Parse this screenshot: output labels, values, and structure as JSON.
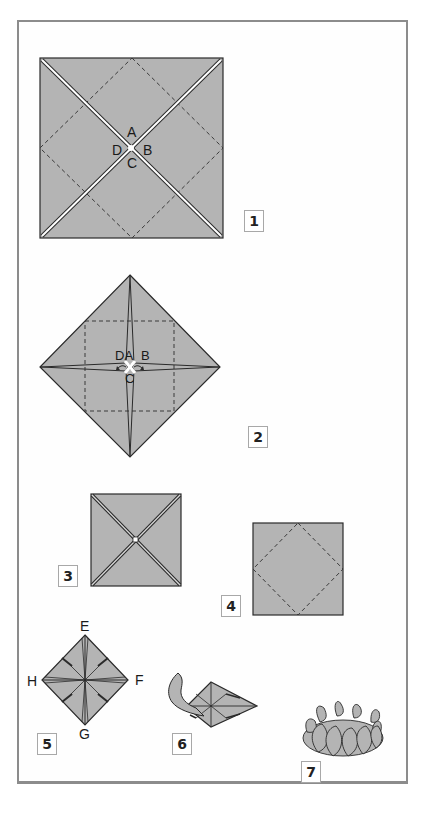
{
  "diagram": {
    "type": "origami-instructions",
    "colors": {
      "paper_fill": "#b4b4b4",
      "outline": "#2a2a2a",
      "frame_border": "#8c8c8c",
      "background": "#ffffff"
    },
    "steps": [
      {
        "number": "1",
        "figure": "square with diagonal creases and dashed inner diamond",
        "point_labels": [
          "A",
          "B",
          "C",
          "D"
        ]
      },
      {
        "number": "2",
        "figure": "diamond with corners folded to center, dashed inner square",
        "point_labels": [
          "D",
          "A",
          "B",
          "C"
        ]
      },
      {
        "number": "3",
        "figure": "small square with diagonal folds"
      },
      {
        "number": "4",
        "figure": "square with dashed inner diamond"
      },
      {
        "number": "5",
        "figure": "diamond with folded flaps",
        "point_labels": [
          "E",
          "F",
          "G",
          "H"
        ]
      },
      {
        "number": "6",
        "figure": "pulling out petal"
      },
      {
        "number": "7",
        "figure": "finished lotus"
      }
    ]
  },
  "labels": {
    "step1": {
      "A": "A",
      "B": "B",
      "C": "C",
      "D": "D",
      "num": "1"
    },
    "step2": {
      "DA": "DA",
      "B": "B",
      "C": "C",
      "num": "2"
    },
    "step3": {
      "num": "3"
    },
    "step4": {
      "num": "4"
    },
    "step5": {
      "E": "E",
      "F": "F",
      "G": "G",
      "H": "H",
      "num": "5"
    },
    "step6": {
      "num": "6"
    },
    "step7": {
      "num": "7"
    }
  }
}
